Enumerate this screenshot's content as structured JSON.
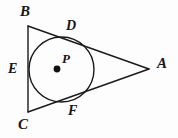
{
  "figure": {
    "name": "triangle-with-inscribed-circle",
    "background_color": "#fdfdfd",
    "stroke_color": "#1a1a1a",
    "label_color": "#161616",
    "stroke_width": 1.4,
    "labels": {
      "A": "A",
      "B": "B",
      "C": "C",
      "D": "D",
      "E": "E",
      "F": "F",
      "P": "P"
    },
    "points": {
      "A": {
        "x": 149,
        "y": 69
      },
      "B": {
        "x": 28,
        "y": 26
      },
      "C": {
        "x": 28,
        "y": 112
      },
      "D": {
        "x": 79,
        "y": 39
      },
      "E": {
        "x": 29,
        "y": 70
      },
      "F": {
        "x": 80,
        "y": 101
      },
      "P": {
        "x": 57,
        "y": 69
      }
    },
    "circle": {
      "cx": 61.5,
      "cy": 69.5,
      "r": 32.5,
      "center_dot_r": 3.4
    },
    "segments": [
      {
        "name": "side-BC",
        "from": "B",
        "to": "C"
      },
      {
        "name": "side-BA",
        "from": "B",
        "to": "A"
      },
      {
        "name": "side-CA",
        "from": "C",
        "to": "A"
      }
    ]
  }
}
